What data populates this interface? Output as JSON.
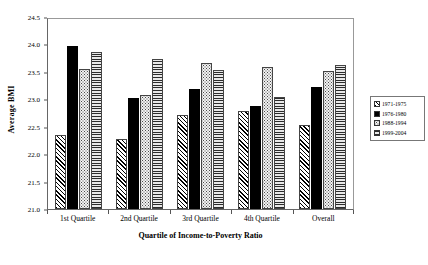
{
  "chart_data": {
    "type": "bar",
    "title": "",
    "xlabel": "Quartile of Income-to-Poverty Ratio",
    "ylabel": "Average BMI",
    "ylim": [
      21.0,
      24.5
    ],
    "yticks": [
      "21.0",
      "21.5",
      "22.0",
      "22.5",
      "23.0",
      "23.5",
      "24.0",
      "24.5"
    ],
    "grid": false,
    "legend_position": "right-outside",
    "categories": [
      "1st Quartile",
      "2nd Quartile",
      "3rd Quartile",
      "4th Quartile",
      "Overall"
    ],
    "series": [
      {
        "name": "1971-1975",
        "pattern": "diagonal-hatch",
        "values": [
          22.35,
          22.27,
          22.72,
          22.78,
          22.53
        ]
      },
      {
        "name": "1976-1980",
        "pattern": "solid-black",
        "values": [
          23.98,
          23.02,
          23.18,
          22.87,
          23.23
        ]
      },
      {
        "name": "1988-1994",
        "pattern": "dotted",
        "values": [
          23.55,
          23.07,
          23.67,
          23.58,
          23.51
        ]
      },
      {
        "name": "1999-2004",
        "pattern": "horizontal-lines",
        "values": [
          23.87,
          23.73,
          23.53,
          23.05,
          23.62
        ]
      }
    ]
  }
}
